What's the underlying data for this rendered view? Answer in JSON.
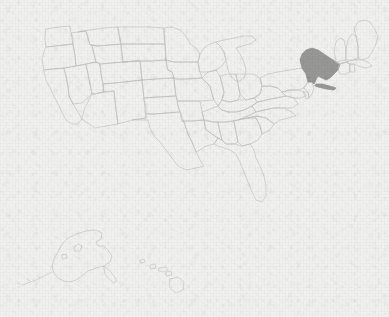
{
  "figure": {
    "kind": "choropleth-locator-map",
    "title": "",
    "caption": "",
    "width_px": 389,
    "height_px": 317
  },
  "colors": {
    "background": "#f6f6f5",
    "state_outline": "#c3c3c3",
    "state_fill_default": "none",
    "highlight_fill": "#9b9b9b",
    "highlight_outline": "#8d8d8d"
  },
  "map": {
    "projection_note": "Albers-style composite with Alaska and Hawaii insets at lower left",
    "highlighted_count": 1,
    "highlighted": [
      {
        "code": "NY",
        "name": "New York",
        "fill": "#9b9b9b"
      }
    ],
    "insets": [
      {
        "code": "AK",
        "name": "Alaska",
        "position": "lower-left"
      },
      {
        "code": "HI",
        "name": "Hawaii",
        "position": "lower-center-left"
      }
    ],
    "states": [
      {
        "code": "WA",
        "name": "Washington",
        "highlighted": false
      },
      {
        "code": "OR",
        "name": "Oregon",
        "highlighted": false
      },
      {
        "code": "CA",
        "name": "California",
        "highlighted": false
      },
      {
        "code": "NV",
        "name": "Nevada",
        "highlighted": false
      },
      {
        "code": "ID",
        "name": "Idaho",
        "highlighted": false
      },
      {
        "code": "MT",
        "name": "Montana",
        "highlighted": false
      },
      {
        "code": "WY",
        "name": "Wyoming",
        "highlighted": false
      },
      {
        "code": "UT",
        "name": "Utah",
        "highlighted": false
      },
      {
        "code": "AZ",
        "name": "Arizona",
        "highlighted": false
      },
      {
        "code": "CO",
        "name": "Colorado",
        "highlighted": false
      },
      {
        "code": "NM",
        "name": "New Mexico",
        "highlighted": false
      },
      {
        "code": "ND",
        "name": "North Dakota",
        "highlighted": false
      },
      {
        "code": "SD",
        "name": "South Dakota",
        "highlighted": false
      },
      {
        "code": "NE",
        "name": "Nebraska",
        "highlighted": false
      },
      {
        "code": "KS",
        "name": "Kansas",
        "highlighted": false
      },
      {
        "code": "OK",
        "name": "Oklahoma",
        "highlighted": false
      },
      {
        "code": "TX",
        "name": "Texas",
        "highlighted": false
      },
      {
        "code": "MN",
        "name": "Minnesota",
        "highlighted": false
      },
      {
        "code": "IA",
        "name": "Iowa",
        "highlighted": false
      },
      {
        "code": "MO",
        "name": "Missouri",
        "highlighted": false
      },
      {
        "code": "AR",
        "name": "Arkansas",
        "highlighted": false
      },
      {
        "code": "LA",
        "name": "Louisiana",
        "highlighted": false
      },
      {
        "code": "WI",
        "name": "Wisconsin",
        "highlighted": false
      },
      {
        "code": "IL",
        "name": "Illinois",
        "highlighted": false
      },
      {
        "code": "MI",
        "name": "Michigan",
        "highlighted": false
      },
      {
        "code": "IN",
        "name": "Indiana",
        "highlighted": false
      },
      {
        "code": "OH",
        "name": "Ohio",
        "highlighted": false
      },
      {
        "code": "KY",
        "name": "Kentucky",
        "highlighted": false
      },
      {
        "code": "TN",
        "name": "Tennessee",
        "highlighted": false
      },
      {
        "code": "MS",
        "name": "Mississippi",
        "highlighted": false
      },
      {
        "code": "AL",
        "name": "Alabama",
        "highlighted": false
      },
      {
        "code": "GA",
        "name": "Georgia",
        "highlighted": false
      },
      {
        "code": "FL",
        "name": "Florida",
        "highlighted": false
      },
      {
        "code": "SC",
        "name": "South Carolina",
        "highlighted": false
      },
      {
        "code": "NC",
        "name": "North Carolina",
        "highlighted": false
      },
      {
        "code": "VA",
        "name": "Virginia",
        "highlighted": false
      },
      {
        "code": "WV",
        "name": "West Virginia",
        "highlighted": false
      },
      {
        "code": "MD",
        "name": "Maryland",
        "highlighted": false
      },
      {
        "code": "DE",
        "name": "Delaware",
        "highlighted": false
      },
      {
        "code": "PA",
        "name": "Pennsylvania",
        "highlighted": false
      },
      {
        "code": "NJ",
        "name": "New Jersey",
        "highlighted": false
      },
      {
        "code": "NY",
        "name": "New York",
        "highlighted": true
      },
      {
        "code": "CT",
        "name": "Connecticut",
        "highlighted": false
      },
      {
        "code": "RI",
        "name": "Rhode Island",
        "highlighted": false
      },
      {
        "code": "MA",
        "name": "Massachusetts",
        "highlighted": false
      },
      {
        "code": "VT",
        "name": "Vermont",
        "highlighted": false
      },
      {
        "code": "NH",
        "name": "New Hampshire",
        "highlighted": false
      },
      {
        "code": "ME",
        "name": "Maine",
        "highlighted": false
      },
      {
        "code": "AK",
        "name": "Alaska",
        "highlighted": false
      },
      {
        "code": "HI",
        "name": "Hawaii",
        "highlighted": false
      }
    ]
  }
}
